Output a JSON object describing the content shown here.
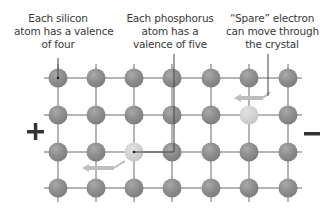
{
  "labels": {
    "silicon": [
      "Each silicon",
      "atom has a valence",
      "of four"
    ],
    "phosphorus": [
      "Each phosphorus",
      "atom has a",
      "valence of five"
    ],
    "spare": [
      "“Spare” electron",
      "can move through",
      "the crystal"
    ]
  },
  "terminals": {
    "positive": "+",
    "negative": "—"
  },
  "lattice": {
    "columns_x": [
      58,
      96,
      134,
      172,
      211,
      249,
      288
    ],
    "rows_y": [
      78,
      115,
      152,
      188
    ],
    "atom_radius": 9.5,
    "phosphorus_atoms": [
      [
        2,
        2
      ]
    ],
    "spare_electron_atoms": [
      [
        5,
        1
      ]
    ]
  },
  "colors": {
    "silicon_atom": "#8e8e8e",
    "phosphorus_atom": "#d2d2d2",
    "bond": "#b5b5b5",
    "arrow": "#bdbdbd",
    "leader_line": "#444444",
    "text": "#3a3a3a",
    "terminal": "#333333"
  }
}
